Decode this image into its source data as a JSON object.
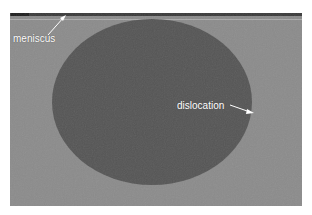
{
  "figure": {
    "background_color": "#8b8b8b",
    "droplet_color": "#555555",
    "meniscus_line_color": "#b4b4b4",
    "annotation_color": "#ffffff"
  },
  "annotations": {
    "meniscus": {
      "label": "meniscus"
    },
    "dislocation": {
      "label": "dislocation"
    }
  }
}
